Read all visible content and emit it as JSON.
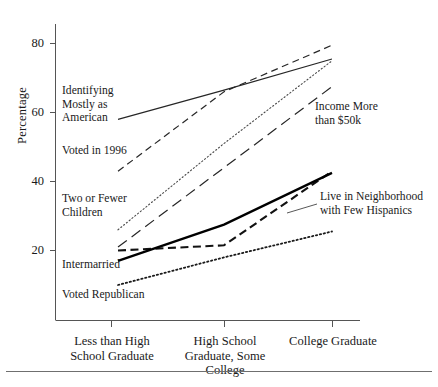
{
  "chart_data": {
    "type": "line",
    "title": "",
    "xlabel": "",
    "ylabel": "Percentage",
    "categories": [
      "Less than\nHigh School\nGraduate",
      "High School\nGraduate,\nSome College",
      "College\nGraduate"
    ],
    "category_labels_flat": [
      "Less than High School Graduate",
      "High School Graduate, Some College",
      "College Graduate"
    ],
    "ylim": [
      0,
      88
    ],
    "yticks": [
      20,
      40,
      60,
      80
    ],
    "ytick_labels": [
      "20",
      "40",
      "60",
      "80"
    ],
    "grid": false,
    "legend": "inline-annotations",
    "series": [
      {
        "name": "Identifying Mostly as American",
        "label": "Identifying\nMostly as\nAmerican",
        "values": [
          58,
          66.5,
          75.5
        ],
        "style": "solid-thin",
        "color": "#262626"
      },
      {
        "name": "Voted in 1996",
        "label": "Voted in 1996",
        "values": [
          43,
          66,
          79.5
        ],
        "style": "dashed-long",
        "color": "#262626"
      },
      {
        "name": "Two or Fewer Children",
        "label": "Two or Fewer\nChildren",
        "values": [
          26,
          51,
          75
        ],
        "style": "dotted-fine",
        "color": "#4a4a4a"
      },
      {
        "name": "Income More than $50k",
        "label": "Income More\nthan $50k",
        "values": [
          21,
          44,
          67.5
        ],
        "style": "dashed-wide",
        "color": "#262626"
      },
      {
        "name": "Live in Neighborhood with Few Hispanics",
        "label": "Live in Neighborhood\nwith Few Hispanics",
        "values": [
          20,
          21.5,
          43
        ],
        "style": "dashed-bold",
        "color": "#121212"
      },
      {
        "name": "Intermarried",
        "label": "Intermarried",
        "values": [
          17,
          27.5,
          42.5
        ],
        "style": "solid-bold",
        "color": "#000000"
      },
      {
        "name": "Voted Republican",
        "label": "Voted Republican",
        "values": [
          10,
          18,
          25.5
        ],
        "style": "dotted-bold",
        "color": "#1a1a1a"
      }
    ],
    "annotations": [
      {
        "name": "identifying-mostly-as-american",
        "text": "Identifying\nMostly as\nAmerican"
      },
      {
        "name": "voted-in-1996",
        "text": "Voted in 1996"
      },
      {
        "name": "two-or-fewer-children",
        "text": "Two or Fewer\nChildren"
      },
      {
        "name": "intermarried",
        "text": "Intermarried"
      },
      {
        "name": "voted-republican",
        "text": "Voted Republican"
      },
      {
        "name": "income-more-than-50k",
        "text": "Income More\nthan $50k"
      },
      {
        "name": "live-in-neighborhood-few-hispanics",
        "text": "Live in Neighborhood\nwith Few Hispanics"
      }
    ]
  },
  "axis": {
    "y_title": "Percentage",
    "ytick_20": "20",
    "ytick_40": "40",
    "ytick_60": "60",
    "ytick_80": "80",
    "xcat_1": "Less than\nHigh School\nGraduate",
    "xcat_2": "High School\nGraduate,\nSome College",
    "xcat_3": "College\nGraduate"
  },
  "labels": {
    "american": "Identifying\nMostly as\nAmerican",
    "voted1996": "Voted in 1996",
    "children": "Two or Fewer\nChildren",
    "intermarried": "Intermarried",
    "republican": "Voted Republican",
    "income": "Income More\nthan $50k",
    "hispanics": "Live in Neighborhood\nwith Few Hispanics"
  }
}
